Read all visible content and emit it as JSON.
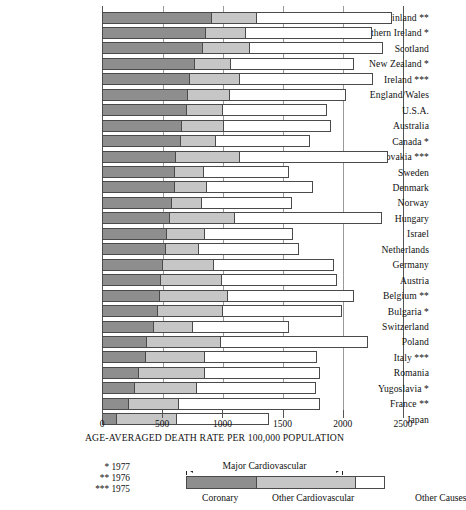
{
  "chart_data": {
    "type": "bar",
    "orientation": "horizontal",
    "stacked": true,
    "title": "",
    "xlabel": "AGE-AVERAGED DEATH RATE PER 100,000 POPULATION",
    "ylabel": "",
    "xlim": [
      0,
      2500
    ],
    "xticks": [
      0,
      500,
      1000,
      1500,
      2000,
      2500
    ],
    "xticklabels": [
      "0",
      "500",
      "1000",
      "1500",
      "2000",
      "2500"
    ],
    "grid": false,
    "legend_position": "bottom",
    "series": [
      {
        "name": "Coronary",
        "color": "#8e8e8e"
      },
      {
        "name": "Other Cardiovascular",
        "color": "#c6c6c6"
      },
      {
        "name": "Other Causes",
        "color": "#ffffff"
      }
    ],
    "categories": [
      "Finland **",
      "Northern Ireland *",
      "Scotland",
      "New Zealand *",
      "Ireland ***",
      "England/Wales",
      "U.S.A.",
      "Australia",
      "Canada *",
      "Czechoslovakia ***",
      "Sweden",
      "Denmark",
      "Norway",
      "Hungary",
      "Israel",
      "Netherlands",
      "Germany",
      "Austria",
      "Belgium **",
      "Bulgaria *",
      "Switzerland",
      "Poland",
      "Italy ***",
      "Romania",
      "Yugoslavia *",
      "France **",
      "Japan"
    ],
    "rows": [
      {
        "country": "Finland **",
        "coronary": 905,
        "other_cv": 375,
        "other_causes": 1125,
        "total": 2405
      },
      {
        "country": "Northern Ireland *",
        "coronary": 855,
        "other_cv": 330,
        "other_causes": 1060,
        "total": 2245
      },
      {
        "country": "Scotland",
        "coronary": 830,
        "other_cv": 390,
        "other_causes": 1110,
        "total": 2330
      },
      {
        "country": "New Zealand *",
        "coronary": 760,
        "other_cv": 300,
        "other_causes": 1030,
        "total": 2090
      },
      {
        "country": "Ireland ***",
        "coronary": 720,
        "other_cv": 420,
        "other_causes": 1110,
        "total": 2250
      },
      {
        "country": "England/Wales",
        "coronary": 710,
        "other_cv": 345,
        "other_causes": 975,
        "total": 2030
      },
      {
        "country": "U.S.A.",
        "coronary": 700,
        "other_cv": 300,
        "other_causes": 870,
        "total": 1870
      },
      {
        "country": "Australia",
        "coronary": 660,
        "other_cv": 345,
        "other_causes": 895,
        "total": 1900
      },
      {
        "country": "Canada *",
        "coronary": 650,
        "other_cv": 290,
        "other_causes": 790,
        "total": 1730
      },
      {
        "country": "Czechoslovakia ***",
        "coronary": 605,
        "other_cv": 530,
        "other_causes": 1240,
        "total": 2375
      },
      {
        "country": "Sweden",
        "coronary": 600,
        "other_cv": 235,
        "other_causes": 720,
        "total": 1555
      },
      {
        "country": "Denmark",
        "coronary": 595,
        "other_cv": 265,
        "other_causes": 890,
        "total": 1750
      },
      {
        "country": "Norway",
        "coronary": 570,
        "other_cv": 250,
        "other_causes": 760,
        "total": 1580
      },
      {
        "country": "Hungary",
        "coronary": 555,
        "other_cv": 545,
        "other_causes": 1225,
        "total": 2325
      },
      {
        "country": "Israel",
        "coronary": 530,
        "other_cv": 320,
        "other_causes": 740,
        "total": 1590
      },
      {
        "country": "Netherlands",
        "coronary": 520,
        "other_cv": 275,
        "other_causes": 845,
        "total": 1640
      },
      {
        "country": "Germany",
        "coronary": 500,
        "other_cv": 425,
        "other_causes": 1000,
        "total": 1925
      },
      {
        "country": "Austria",
        "coronary": 480,
        "other_cv": 510,
        "other_causes": 960,
        "total": 1950
      },
      {
        "country": "Belgium **",
        "coronary": 470,
        "other_cv": 570,
        "other_causes": 1055,
        "total": 2095
      },
      {
        "country": "Bulgaria *",
        "coronary": 455,
        "other_cv": 540,
        "other_causes": 1000,
        "total": 1995
      },
      {
        "country": "Switzerland",
        "coronary": 420,
        "other_cv": 330,
        "other_causes": 800,
        "total": 1550
      },
      {
        "country": "Poland",
        "coronary": 365,
        "other_cv": 615,
        "other_causes": 1230,
        "total": 2210
      },
      {
        "country": "Italy ***",
        "coronary": 355,
        "other_cv": 490,
        "other_causes": 940,
        "total": 1785
      },
      {
        "country": "Romania",
        "coronary": 300,
        "other_cv": 550,
        "other_causes": 960,
        "total": 1810
      },
      {
        "country": "Yugoslavia *",
        "coronary": 265,
        "other_cv": 520,
        "other_causes": 990,
        "total": 1775
      },
      {
        "country": "France **",
        "coronary": 215,
        "other_cv": 420,
        "other_causes": 1175,
        "total": 1810
      },
      {
        "country": "Japan",
        "coronary": 120,
        "other_cv": 495,
        "other_causes": 775,
        "total": 1390
      }
    ]
  },
  "footnotes": {
    "line1": "*   1977",
    "line2": "**  1976",
    "line3": "*** 1975"
  },
  "legend": {
    "bracket_label": "Major Cardiovascular",
    "coronary_label": "Coronary",
    "other_cv_label": "Other Cardiovascular",
    "other_causes_label": "Other Causes"
  }
}
